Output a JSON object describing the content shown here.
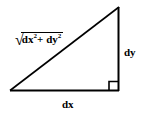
{
  "diagram": {
    "name": "right-triangle-pythagorean-diagram",
    "background_color": "#ffffff",
    "stroke_color": "#000000",
    "vertices": {
      "bottom_left": [
        10,
        91
      ],
      "bottom_right": [
        119,
        91
      ],
      "top_right": [
        119,
        7
      ]
    },
    "right_angle_marker": {
      "present": true,
      "corner": "bottom-right",
      "size": 9
    },
    "labels": {
      "hypotenuse": {
        "radical_sign": "√",
        "term_one_base": "dx",
        "term_one_exponent": "2",
        "operator": "+",
        "term_two_base": "dy",
        "term_two_exponent": "2",
        "plain_text": "√(dx² + dy²)"
      },
      "vertical_side": "dy",
      "horizontal_side": "dx"
    }
  }
}
